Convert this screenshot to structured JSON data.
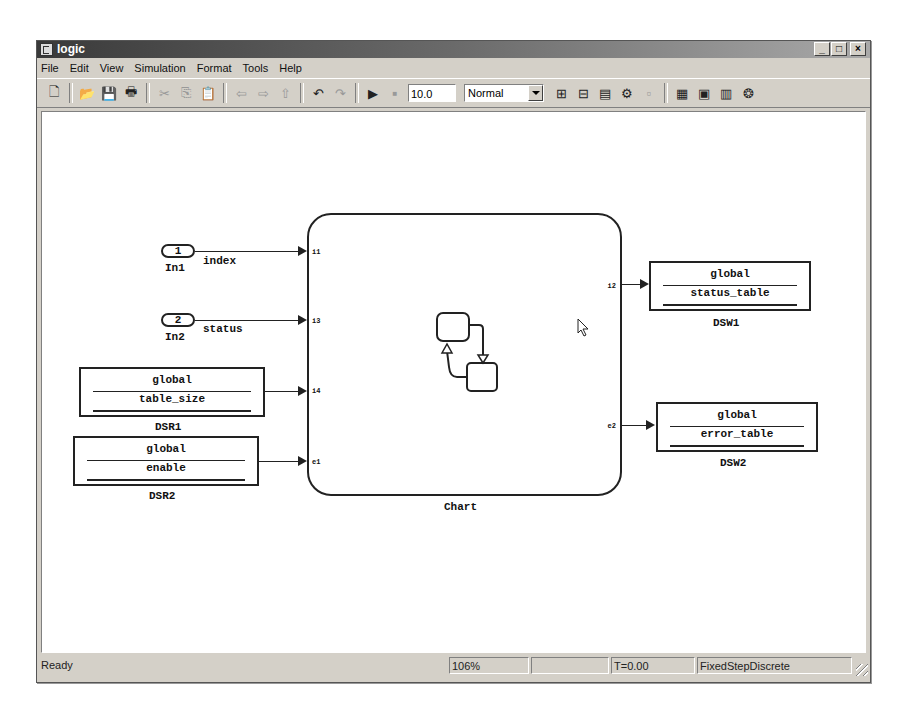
{
  "window": {
    "title": "logic",
    "controls": [
      "minimize",
      "maximize",
      "close"
    ]
  },
  "menu": [
    "File",
    "Edit",
    "View",
    "Simulation",
    "Format",
    "Tools",
    "Help"
  ],
  "toolbar": {
    "buttons": [
      {
        "name": "new-model-icon",
        "glyph": "🗋"
      },
      {
        "name": "open-icon",
        "glyph": "📂"
      },
      {
        "name": "save-icon",
        "glyph": "💾"
      },
      {
        "name": "print-icon",
        "glyph": "🖶"
      },
      {
        "name": "cut-icon",
        "glyph": "✂"
      },
      {
        "name": "copy-icon",
        "glyph": "⎘"
      },
      {
        "name": "paste-icon",
        "glyph": "📋"
      },
      {
        "name": "back-icon",
        "glyph": "⇦"
      },
      {
        "name": "forward-icon",
        "glyph": "⇨"
      },
      {
        "name": "up-icon",
        "glyph": "⇧"
      },
      {
        "name": "undo-icon",
        "glyph": "↶"
      },
      {
        "name": "redo-icon",
        "glyph": "↷"
      },
      {
        "name": "start-simulation-icon",
        "glyph": "▶"
      },
      {
        "name": "stop-simulation-icon",
        "glyph": "■"
      }
    ],
    "stop_time": "10.0",
    "sim_mode": "Normal",
    "right_buttons": [
      {
        "name": "build-icon",
        "glyph": "⊞"
      },
      {
        "name": "update-diagram-icon",
        "glyph": "⊟"
      },
      {
        "name": "model-explorer-icon",
        "glyph": "▤"
      },
      {
        "name": "debug-icon",
        "glyph": "⚙"
      },
      {
        "name": "disabled-tool-icon",
        "glyph": "▫"
      },
      {
        "name": "library-browser-icon",
        "glyph": "▦"
      },
      {
        "name": "model-browser-icon",
        "glyph": "▣"
      },
      {
        "name": "explorer-icon",
        "glyph": "▥"
      },
      {
        "name": "stateflow-icon",
        "glyph": "❂"
      }
    ]
  },
  "diagram": {
    "inports": [
      {
        "number": "1",
        "name": "In1",
        "signal": "index"
      },
      {
        "number": "2",
        "name": "In2",
        "signal": "status"
      }
    ],
    "data_store_reads": [
      {
        "scope": "global",
        "variable": "table_size",
        "name": "DSR1"
      },
      {
        "scope": "global",
        "variable": "enable",
        "name": "DSR2"
      }
    ],
    "data_store_writes": [
      {
        "scope": "global",
        "variable": "status_table",
        "name": "DSW1"
      },
      {
        "scope": "global",
        "variable": "error_table",
        "name": "DSW2"
      }
    ],
    "chart": {
      "name": "Chart",
      "input_ports": [
        "i1",
        "i3",
        "i4",
        "e1"
      ],
      "output_ports": [
        "i2",
        "e2"
      ]
    }
  },
  "status": {
    "state": "Ready",
    "zoom": "106%",
    "progress": "",
    "time": "T=0.00",
    "solver": "FixedStepDiscrete"
  }
}
